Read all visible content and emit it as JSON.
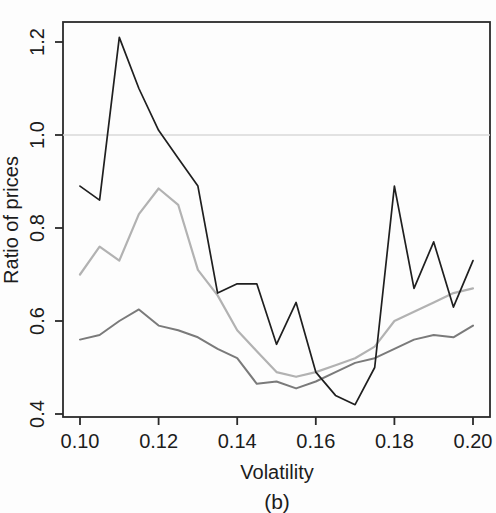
{
  "figure": {
    "width": 496,
    "height": 513,
    "background": "#fdfdfd",
    "text_color": "#1c1c1c",
    "box_color": "#2a2a2a"
  },
  "chart_data": {
    "type": "line",
    "title": "",
    "xlabel": "Volatility",
    "ylabel": "Ratio of prices",
    "caption": "(b)",
    "xlim": [
      0.1,
      0.2
    ],
    "ylim": [
      0.4,
      1.2
    ],
    "x_ticks": {
      "values": [
        0.1,
        0.12,
        0.14,
        0.16,
        0.18,
        0.2
      ],
      "labels": [
        "0.10",
        "0.12",
        "0.14",
        "0.16",
        "0.18",
        "0.20"
      ]
    },
    "y_ticks": {
      "values": [
        0.4,
        0.6,
        0.8,
        1.0,
        1.2
      ],
      "labels": [
        "0.4",
        "0.6",
        "0.8",
        "1.0",
        "1.2"
      ]
    },
    "grid": {
      "horizontal_reference_line_y": 1.0,
      "color": "#d9d9d9"
    },
    "legend": null,
    "x": [
      0.1,
      0.105,
      0.11,
      0.115,
      0.12,
      0.125,
      0.13,
      0.135,
      0.14,
      0.145,
      0.15,
      0.155,
      0.16,
      0.165,
      0.17,
      0.175,
      0.18,
      0.185,
      0.19,
      0.195,
      0.2
    ],
    "series": [
      {
        "name": "upper-volatile-line",
        "color": "#1f1f1f",
        "stroke_width": 1.7,
        "values": [
          0.89,
          0.86,
          1.21,
          1.1,
          1.01,
          0.95,
          0.89,
          0.66,
          0.68,
          0.68,
          0.55,
          0.64,
          0.49,
          0.44,
          0.42,
          0.5,
          0.89,
          0.67,
          0.77,
          0.63,
          0.73
        ]
      },
      {
        "name": "middle-light-gray-line",
        "color": "#b2b2b2",
        "stroke_width": 2.2,
        "values": [
          0.7,
          0.76,
          0.73,
          0.83,
          0.885,
          0.85,
          0.71,
          0.655,
          0.58,
          0.535,
          0.49,
          0.48,
          0.49,
          0.505,
          0.52,
          0.545,
          0.6,
          0.62,
          0.64,
          0.66,
          0.67
        ]
      },
      {
        "name": "lower-dark-gray-line",
        "color": "#7a7a7a",
        "stroke_width": 2.0,
        "values": [
          0.56,
          0.57,
          0.6,
          0.625,
          0.59,
          0.58,
          0.565,
          0.54,
          0.52,
          0.465,
          0.47,
          0.455,
          0.47,
          0.49,
          0.51,
          0.52,
          0.54,
          0.56,
          0.57,
          0.565,
          0.59
        ]
      }
    ]
  }
}
